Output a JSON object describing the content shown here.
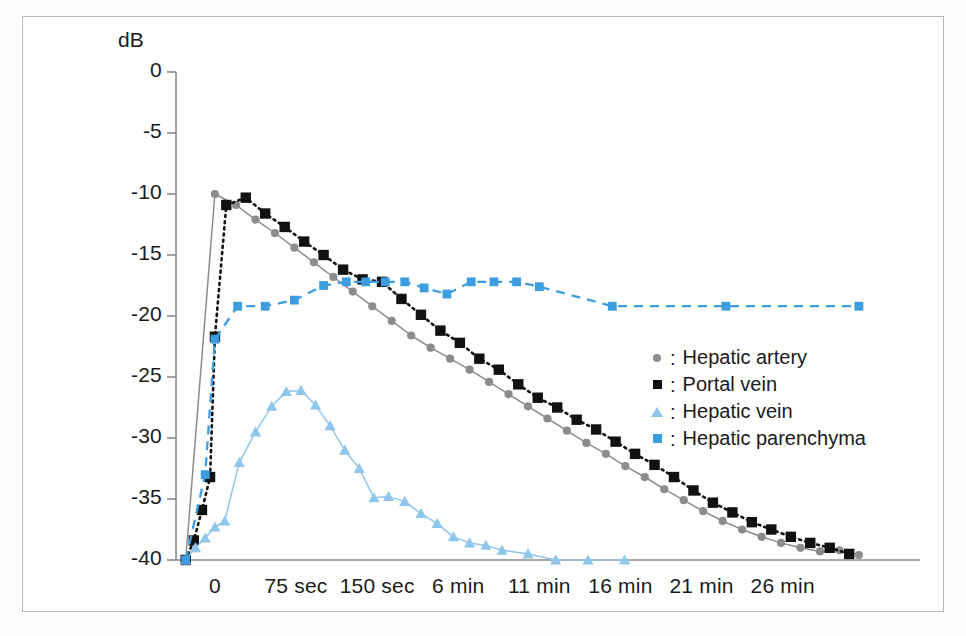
{
  "figure": {
    "unit_label": "dB",
    "background_color": "#ffffff",
    "frame_color": "#b9bcbe"
  },
  "chart_data": {
    "type": "line",
    "title": "",
    "xlabel": "",
    "ylabel": "dB",
    "ylim": [
      -40,
      0
    ],
    "yticks": [
      0,
      -5,
      -10,
      -15,
      -20,
      -25,
      -30,
      -35,
      -40
    ],
    "ytick_labels": [
      "0",
      "-5",
      "-10",
      "-15",
      "-20",
      "-25",
      "-30",
      "-35",
      "-40"
    ],
    "xtick_labels": [
      "0",
      "75 sec",
      "150 sec",
      "6 min",
      "11 min",
      "16 min",
      "21 min",
      "26 min"
    ],
    "xtick_positions": [
      0,
      1,
      2,
      3,
      4,
      5,
      6,
      7
    ],
    "xlim": [
      -0.48,
      8.2
    ],
    "grid": false,
    "legend_position": "center-right",
    "series": [
      {
        "name": "Hepatic artery",
        "color": "#8c8c8c",
        "marker": "circle",
        "linestyle": "solid",
        "x": [
          -0.36,
          0.0,
          0.26,
          0.5,
          0.74,
          0.98,
          1.22,
          1.46,
          1.7,
          1.94,
          2.18,
          2.42,
          2.66,
          2.9,
          3.14,
          3.38,
          3.62,
          3.86,
          4.1,
          4.34,
          4.58,
          4.82,
          5.06,
          5.3,
          5.54,
          5.78,
          6.02,
          6.26,
          6.5,
          6.74,
          6.98,
          7.22,
          7.46,
          7.7,
          7.94
        ],
        "y": [
          -40.0,
          -10.0,
          -10.9,
          -12.1,
          -13.2,
          -14.4,
          -15.6,
          -16.8,
          -18.0,
          -19.2,
          -20.4,
          -21.6,
          -22.6,
          -23.5,
          -24.4,
          -25.4,
          -26.4,
          -27.4,
          -28.4,
          -29.4,
          -30.4,
          -31.3,
          -32.3,
          -33.2,
          -34.2,
          -35.1,
          -36.0,
          -36.8,
          -37.5,
          -38.1,
          -38.6,
          -39.0,
          -39.3,
          -39.2,
          -39.6
        ]
      },
      {
        "name": "Portal vein",
        "color": "#111111",
        "marker": "square",
        "linestyle": "dotted",
        "x": [
          -0.36,
          -0.26,
          -0.16,
          -0.06,
          0.0,
          0.14,
          0.38,
          0.62,
          0.86,
          1.1,
          1.34,
          1.58,
          1.82,
          2.06,
          2.3,
          2.54,
          2.78,
          3.02,
          3.26,
          3.5,
          3.74,
          3.98,
          4.22,
          4.46,
          4.7,
          4.94,
          5.18,
          5.42,
          5.66,
          5.9,
          6.14,
          6.38,
          6.62,
          6.86,
          7.1,
          7.34,
          7.58,
          7.82
        ],
        "y": [
          -40.0,
          -38.4,
          -35.9,
          -33.2,
          -21.7,
          -10.9,
          -10.3,
          -11.6,
          -12.7,
          -13.9,
          -15.0,
          -16.2,
          -17.0,
          -17.2,
          -18.6,
          -19.9,
          -21.2,
          -22.2,
          -23.5,
          -24.4,
          -25.6,
          -26.7,
          -27.5,
          -28.5,
          -29.3,
          -30.3,
          -31.3,
          -32.2,
          -33.2,
          -34.3,
          -35.3,
          -36.1,
          -36.9,
          -37.5,
          -38.1,
          -38.6,
          -39.0,
          -39.5
        ]
      },
      {
        "name": "Hepatic vein",
        "color": "#8fc6ec",
        "marker": "triangle",
        "linestyle": "solid",
        "x": [
          -0.36,
          -0.24,
          -0.12,
          0.0,
          0.12,
          0.3,
          0.5,
          0.7,
          0.88,
          1.06,
          1.24,
          1.42,
          1.6,
          1.78,
          1.96,
          2.14,
          2.34,
          2.54,
          2.74,
          2.94,
          3.14,
          3.34,
          3.54,
          3.86,
          4.2,
          4.6,
          5.05
        ],
        "y": [
          -40.0,
          -39.0,
          -38.2,
          -37.3,
          -36.8,
          -32.0,
          -29.5,
          -27.4,
          -26.2,
          -26.1,
          -27.3,
          -29.0,
          -31.0,
          -32.5,
          -34.9,
          -34.8,
          -35.2,
          -36.2,
          -37.0,
          -38.1,
          -38.6,
          -38.8,
          -39.2,
          -39.5,
          -40.0,
          -40.0,
          -40.0
        ]
      },
      {
        "name": "Hepatic parenchyma",
        "color": "#3c9ee0",
        "marker": "square",
        "linestyle": "dashed",
        "x": [
          -0.36,
          -0.12,
          0.0,
          0.28,
          0.62,
          0.98,
          1.34,
          1.62,
          1.86,
          2.1,
          2.34,
          2.58,
          2.86,
          3.16,
          3.44,
          3.72,
          4.0,
          4.9,
          6.3,
          7.94
        ],
        "y": [
          -40.0,
          -33.0,
          -21.9,
          -19.2,
          -19.2,
          -18.7,
          -17.5,
          -17.2,
          -17.2,
          -17.2,
          -17.2,
          -17.7,
          -18.2,
          -17.2,
          -17.2,
          -17.2,
          -17.6,
          -19.2,
          -19.2,
          -19.2
        ]
      }
    ]
  },
  "legend": {
    "entries": [
      {
        "label": "Hepatic artery",
        "marker": "circle-gray",
        "separator": ":"
      },
      {
        "label": "Portal vein",
        "marker": "square-black",
        "separator": ":"
      },
      {
        "label": "Hepatic vein",
        "marker": "triangle-lightblue",
        "separator": ":"
      },
      {
        "label": "Hepatic parenchyma",
        "marker": "square-blue",
        "separator": ":"
      }
    ]
  }
}
